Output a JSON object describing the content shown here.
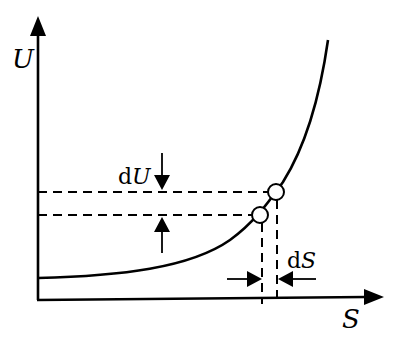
{
  "diagram": {
    "type": "U-S curve with differential increments",
    "colors": {
      "ink": "#000000",
      "background": "#ffffff",
      "marker_fill": "#ffffff"
    },
    "axes": {
      "y_label": "U",
      "x_label": "S"
    },
    "annotations": {
      "dU": {
        "prefix": "d",
        "var": "U"
      },
      "dS": {
        "prefix": "d",
        "var": "S"
      }
    },
    "points": [
      {
        "name": "lower-point",
        "description": "state (S, U)"
      },
      {
        "name": "upper-point",
        "description": "state (S+dS, U+dU)"
      }
    ]
  }
}
